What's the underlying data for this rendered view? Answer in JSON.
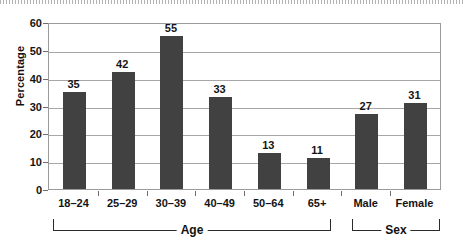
{
  "chart_data": {
    "type": "bar",
    "title": "",
    "xlabel": "",
    "ylabel": "Percentage",
    "ylim": [
      0,
      60
    ],
    "ytick_values": [
      60,
      50,
      40,
      30,
      20,
      10,
      0
    ],
    "grid": true,
    "legend": "none",
    "categories": [
      "18–24",
      "25–29",
      "30–39",
      "40–49",
      "50–64",
      "65+",
      "Male",
      "Female"
    ],
    "values": [
      35,
      42,
      55,
      33,
      13,
      11,
      27,
      31
    ],
    "value_labels": [
      "35",
      "42",
      "55",
      "33",
      "13",
      "11",
      "27",
      "31"
    ],
    "groups": [
      {
        "label": "Age",
        "categories": [
          "18–24",
          "25–29",
          "30–39",
          "40–49",
          "50–64",
          "65+"
        ]
      },
      {
        "label": "Sex",
        "categories": [
          "Male",
          "Female"
        ]
      }
    ],
    "bar_color": "#414141",
    "grid_color": "#a7a7a7",
    "axis_color": "#9a9a9a",
    "text_color": "#141414",
    "background_color": "#ffffff"
  }
}
